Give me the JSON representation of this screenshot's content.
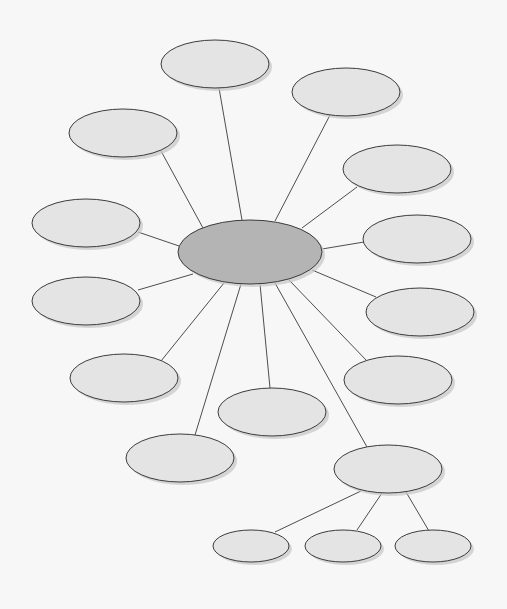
{
  "diagram": {
    "type": "mind-map",
    "background_color": "#f7f7f7",
    "center_fill": "#b4b4b4",
    "node_fill": "#e4e4e4",
    "shadow_color": "#c8c8c8",
    "center": {
      "id": "center",
      "cx": 250,
      "cy": 252,
      "rx": 72,
      "ry": 32,
      "label": ""
    },
    "nodes": [
      {
        "id": "n-top",
        "cx": 215,
        "cy": 64,
        "rx": 54,
        "ry": 24,
        "label": ""
      },
      {
        "id": "n-top-right",
        "cx": 346,
        "cy": 92,
        "rx": 54,
        "ry": 24,
        "label": ""
      },
      {
        "id": "n-left-upper",
        "cx": 123,
        "cy": 133,
        "rx": 54,
        "ry": 24,
        "label": ""
      },
      {
        "id": "n-right-upper",
        "cx": 397,
        "cy": 169,
        "rx": 54,
        "ry": 24,
        "label": ""
      },
      {
        "id": "n-left-mid-upper",
        "cx": 86,
        "cy": 223,
        "rx": 54,
        "ry": 24,
        "label": ""
      },
      {
        "id": "n-right-mid-upper",
        "cx": 417,
        "cy": 239,
        "rx": 54,
        "ry": 24,
        "label": ""
      },
      {
        "id": "n-left-mid-lower",
        "cx": 86,
        "cy": 301,
        "rx": 54,
        "ry": 24,
        "label": ""
      },
      {
        "id": "n-right-mid-lower",
        "cx": 420,
        "cy": 312,
        "rx": 54,
        "ry": 24,
        "label": ""
      },
      {
        "id": "n-lower-left",
        "cx": 124,
        "cy": 378,
        "rx": 54,
        "ry": 24,
        "label": ""
      },
      {
        "id": "n-lower-right",
        "cx": 398,
        "cy": 380,
        "rx": 54,
        "ry": 24,
        "label": ""
      },
      {
        "id": "n-bottom-center",
        "cx": 272,
        "cy": 412,
        "rx": 54,
        "ry": 24,
        "label": ""
      },
      {
        "id": "n-bottom-left",
        "cx": 180,
        "cy": 458,
        "rx": 54,
        "ry": 24,
        "label": ""
      },
      {
        "id": "n-bottom-right",
        "cx": 388,
        "cy": 469,
        "rx": 54,
        "ry": 24,
        "label": ""
      },
      {
        "id": "n-child-1",
        "cx": 251,
        "cy": 546,
        "rx": 38,
        "ry": 16,
        "label": ""
      },
      {
        "id": "n-child-2",
        "cx": 343,
        "cy": 546,
        "rx": 38,
        "ry": 16,
        "label": ""
      },
      {
        "id": "n-child-3",
        "cx": 433,
        "cy": 546,
        "rx": 38,
        "ry": 16,
        "label": ""
      }
    ],
    "edges": [
      {
        "from": "center",
        "to": "n-top",
        "x1": 242,
        "y1": 220,
        "x2": 219,
        "y2": 88
      },
      {
        "from": "center",
        "to": "n-top-right",
        "x1": 275,
        "y1": 221,
        "x2": 330,
        "y2": 115
      },
      {
        "from": "center",
        "to": "n-left-upper",
        "x1": 203,
        "y1": 228,
        "x2": 161,
        "y2": 151
      },
      {
        "from": "center",
        "to": "n-right-upper",
        "x1": 302,
        "y1": 228,
        "x2": 357,
        "y2": 187
      },
      {
        "from": "center",
        "to": "n-left-mid-upper",
        "x1": 179,
        "y1": 246,
        "x2": 138,
        "y2": 232
      },
      {
        "from": "center",
        "to": "n-right-mid-upper",
        "x1": 322,
        "y1": 249,
        "x2": 364,
        "y2": 242
      },
      {
        "from": "center",
        "to": "n-left-mid-lower",
        "x1": 193,
        "y1": 274,
        "x2": 138,
        "y2": 290
      },
      {
        "from": "center",
        "to": "n-right-mid-lower",
        "x1": 312,
        "y1": 270,
        "x2": 376,
        "y2": 297
      },
      {
        "from": "center",
        "to": "n-lower-left",
        "x1": 224,
        "y1": 283,
        "x2": 161,
        "y2": 361
      },
      {
        "from": "center",
        "to": "n-lower-right",
        "x1": 289,
        "y1": 280,
        "x2": 367,
        "y2": 361
      },
      {
        "from": "center",
        "to": "n-bottom-center",
        "x1": 260,
        "y1": 284,
        "x2": 270,
        "y2": 388
      },
      {
        "from": "center",
        "to": "n-bottom-left",
        "x1": 241,
        "y1": 284,
        "x2": 195,
        "y2": 435
      },
      {
        "from": "center",
        "to": "n-bottom-right",
        "x1": 275,
        "y1": 283,
        "x2": 367,
        "y2": 447
      },
      {
        "from": "n-bottom-right",
        "to": "n-child-1",
        "x1": 361,
        "y1": 491,
        "x2": 275,
        "y2": 532
      },
      {
        "from": "n-bottom-right",
        "to": "n-child-2",
        "x1": 382,
        "y1": 493,
        "x2": 357,
        "y2": 530
      },
      {
        "from": "n-bottom-right",
        "to": "n-child-3",
        "x1": 406,
        "y1": 492,
        "x2": 429,
        "y2": 531
      }
    ]
  }
}
